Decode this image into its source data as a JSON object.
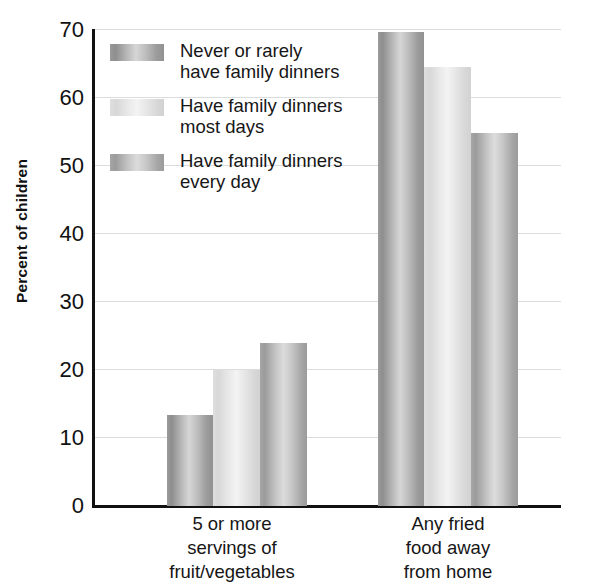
{
  "chart_data": {
    "type": "bar",
    "title": "",
    "subtitle": "",
    "xlabel": "",
    "ylabel": "Percent of children",
    "ylim": [
      0,
      70
    ],
    "ytick_step": 10,
    "yticks": [
      70,
      60,
      50,
      40,
      30,
      20,
      10,
      0
    ],
    "grid": true,
    "grid_axis": "y",
    "legend_position": "upper-left-inside",
    "categories": [
      "5 or more\nservings of\nfruit/vegetables",
      "Any fried\nfood away\nfrom home"
    ],
    "series": [
      {
        "name": "Never or rarely\nhave family dinners",
        "color": "#a8a8a8",
        "values": [
          13.4,
          69.6
        ]
      },
      {
        "name": "Have family dinners\nmost days",
        "color": "#e6e6e6",
        "values": [
          20.0,
          64.4
        ]
      },
      {
        "name": "Have family dinners\nevery day",
        "color": "#bcbcbc",
        "values": [
          23.9,
          54.8
        ]
      }
    ]
  },
  "axis": {
    "tick_0": "0",
    "tick_10": "10",
    "tick_20": "20",
    "tick_30": "30",
    "tick_40": "40",
    "tick_50": "50",
    "tick_60": "60",
    "tick_70": "70"
  },
  "colors": {
    "axis": "#111111",
    "grid": "#d9dde0",
    "text": "#161616",
    "background": "#ffffff"
  }
}
